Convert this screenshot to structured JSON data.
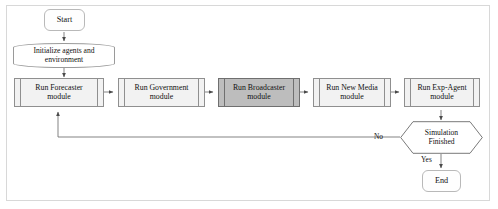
{
  "diagram": {
    "type": "flowchart",
    "orientation": "left-to-right with feedback loop",
    "colors": {
      "canvas_background": "#ffffff",
      "frame_border": "#d8d8d8",
      "node_fill": "#f2f2f2",
      "node_stroke": "#8f8f8f",
      "highlight_fill": "#bdbdbd",
      "highlight_stroke": "#6f6f6f",
      "terminator_stroke": "#b9b9b9",
      "connector": "#6e6e6e",
      "text": "#111111"
    },
    "nodes": [
      {
        "id": "start",
        "label": "Start",
        "shape": "terminator",
        "highlighted": false
      },
      {
        "id": "init",
        "label": "Initialize agents and environment",
        "shape": "stored-data",
        "highlighted": false
      },
      {
        "id": "forecaster",
        "label": "Run Forecaster module",
        "shape": "predefined-process",
        "highlighted": false
      },
      {
        "id": "government",
        "label": "Run Government module",
        "shape": "predefined-process",
        "highlighted": false
      },
      {
        "id": "broadcaster",
        "label": "Run Broadcaster module",
        "shape": "predefined-process",
        "highlighted": true
      },
      {
        "id": "newmedia",
        "label": "Run New Media module",
        "shape": "predefined-process",
        "highlighted": false
      },
      {
        "id": "expagent",
        "label": "Run Exp-Agent module",
        "shape": "predefined-process",
        "highlighted": false
      },
      {
        "id": "decision",
        "label": "Simulation Finished",
        "shape": "hexagon",
        "highlighted": false
      },
      {
        "id": "end",
        "label": "End",
        "shape": "terminator",
        "highlighted": false
      }
    ],
    "node_text": {
      "start": "Start",
      "init_line1": "Initialize agents and",
      "init_line2": "environment",
      "forecaster_line1": "Run Forecaster",
      "forecaster_line2": "module",
      "government_line1": "Run Government",
      "government_line2": "module",
      "broadcaster_line1": "Run Broadcaster",
      "broadcaster_line2": "module",
      "newmedia_line1": "Run New Media",
      "newmedia_line2": "module",
      "expagent_line1": "Run Exp-Agent",
      "expagent_line2": "module",
      "decision_line1": "Simulation",
      "decision_line2": "Finished",
      "end": "End"
    },
    "edges": [
      {
        "from": "start",
        "to": "init",
        "label": ""
      },
      {
        "from": "init",
        "to": "forecaster",
        "label": ""
      },
      {
        "from": "forecaster",
        "to": "government",
        "label": ""
      },
      {
        "from": "government",
        "to": "broadcaster",
        "label": ""
      },
      {
        "from": "broadcaster",
        "to": "newmedia",
        "label": ""
      },
      {
        "from": "newmedia",
        "to": "expagent",
        "label": ""
      },
      {
        "from": "expagent",
        "to": "decision",
        "label": ""
      },
      {
        "from": "decision",
        "to": "forecaster",
        "label": "No"
      },
      {
        "from": "decision",
        "to": "end",
        "label": "Yes"
      }
    ],
    "edge_labels": {
      "no": "No",
      "yes": "Yes"
    }
  }
}
